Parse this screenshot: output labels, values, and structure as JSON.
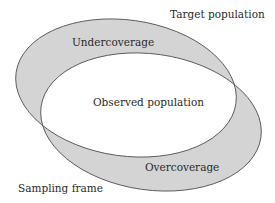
{
  "diagram": {
    "type": "venn-two-ellipses",
    "colors": {
      "fill": "#d4d4d4",
      "overlap": "#ffffff",
      "stroke": "#555555",
      "text": "#2b2b2b"
    },
    "sets": [
      {
        "id": "target",
        "label": "Target population"
      },
      {
        "id": "frame",
        "label": "Sampling frame"
      }
    ],
    "regions": {
      "target_only": "Undercoverage",
      "intersection": "Observed population",
      "frame_only": "Overcoverage"
    }
  }
}
